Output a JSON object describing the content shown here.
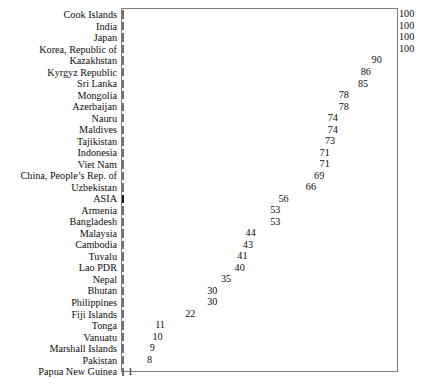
{
  "figure": {
    "cropped_caption_fragment": "",
    "highlight_category": "ASIA"
  },
  "chart_data": {
    "type": "bar",
    "orientation": "horizontal",
    "title": "",
    "subtitle": "",
    "xlabel": "",
    "ylabel": "",
    "xlim": [
      0,
      100
    ],
    "grid": false,
    "legend": null,
    "value_labels": true,
    "highlight": {
      "category": "ASIA",
      "color": "#2e2e2e"
    },
    "bar_color": "#bdbdbd",
    "bar_border_color": "#6f6f6f",
    "categories": [
      "Cook Islands",
      "India",
      "Japan",
      "Korea, Republic of",
      "Kazakhstan",
      "Kyrgyz Republic",
      "Sri Lanka",
      "Mongolia",
      "Azerbaijan",
      "Nauru",
      "Maldives",
      "Tajikistan",
      "Indonesia",
      "Viet Nam",
      "China, People’s Rep. of",
      "Uzbekistan",
      "ASIA",
      "Armenia",
      "Bangladesh",
      "Malaysia",
      "Cambodia",
      "Tuvalu",
      "Lao PDR",
      "Nepal",
      "Bhutan",
      "Philippines",
      "Fiji Islands",
      "Tonga",
      "Vanuatu",
      "Marshall Islands",
      "Pakistan",
      "Papua New Guinea"
    ],
    "values": [
      100,
      100,
      100,
      100,
      90,
      86,
      85,
      78,
      78,
      74,
      74,
      73,
      71,
      71,
      69,
      66,
      56,
      53,
      53,
      44,
      43,
      41,
      40,
      35,
      30,
      30,
      22,
      11,
      10,
      9,
      8,
      1
    ]
  }
}
